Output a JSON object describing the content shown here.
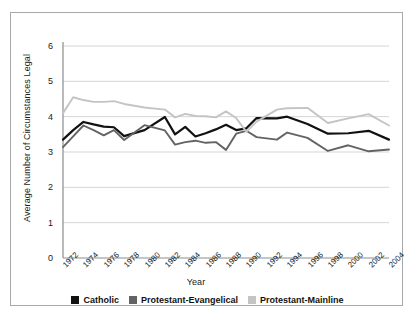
{
  "chart_data": {
    "type": "line",
    "title": "",
    "xlabel": "Year",
    "ylabel": "Average Number of Circumstances Legal",
    "xlim": [
      1972,
      2004
    ],
    "ylim": [
      0,
      6
    ],
    "grid": true,
    "legend_position": "bottom",
    "y_ticks": [
      0,
      1,
      2,
      3,
      4,
      5,
      6
    ],
    "categories": [
      1972,
      1973,
      1974,
      1975,
      1976,
      1977,
      1978,
      1980,
      1982,
      1983,
      1984,
      1985,
      1986,
      1987,
      1988,
      1989,
      1990,
      1991,
      1993,
      1994,
      1996,
      1998,
      2000,
      2002,
      2004
    ],
    "x_tick_labels": [
      "1972",
      "1974",
      "1976",
      "1978",
      "1980",
      "1982",
      "1984",
      "1986",
      "1988",
      "1990",
      "1992",
      "1994",
      "1996",
      "1998",
      "2000",
      "2002",
      "2004"
    ],
    "x_tick_values": [
      1972,
      1974,
      1976,
      1978,
      1980,
      1982,
      1984,
      1986,
      1988,
      1990,
      1992,
      1994,
      1996,
      1998,
      2000,
      2002,
      2004
    ],
    "series": [
      {
        "name": "Catholic",
        "color": "#111111",
        "values": [
          3.35,
          3.62,
          3.85,
          3.78,
          3.72,
          3.7,
          3.45,
          3.62,
          3.99,
          3.5,
          3.71,
          3.44,
          3.53,
          3.64,
          3.77,
          3.62,
          3.67,
          3.96,
          3.95,
          4.0,
          3.79,
          3.52,
          3.53,
          3.6,
          3.35
        ]
      },
      {
        "name": "Protestant-Evangelical",
        "color": "#636363",
        "values": [
          3.14,
          3.44,
          3.75,
          3.62,
          3.47,
          3.62,
          3.34,
          3.76,
          3.61,
          3.21,
          3.28,
          3.32,
          3.26,
          3.28,
          3.06,
          3.52,
          3.6,
          3.42,
          3.35,
          3.55,
          3.4,
          3.03,
          3.19,
          3.02,
          3.07
        ]
      },
      {
        "name": "Protestant-Mainline",
        "color": "#c4c4c4",
        "values": [
          4.1,
          4.55,
          4.47,
          4.42,
          4.42,
          4.44,
          4.36,
          4.26,
          4.2,
          3.98,
          4.08,
          4.02,
          4.01,
          3.98,
          4.15,
          3.96,
          3.57,
          3.86,
          4.2,
          4.24,
          4.25,
          3.82,
          3.95,
          4.07,
          3.75
        ]
      }
    ]
  },
  "legend": {
    "items": [
      {
        "label": "Catholic",
        "color": "#111111"
      },
      {
        "label": "Protestant-Evangelical",
        "color": "#636363"
      },
      {
        "label": "Protestant-Mainline",
        "color": "#c4c4c4"
      }
    ]
  }
}
